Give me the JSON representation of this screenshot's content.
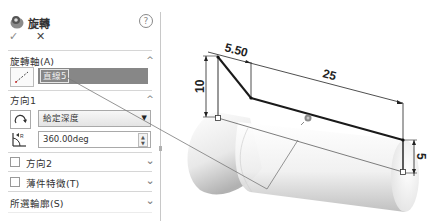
{
  "feature": {
    "title": "旋轉",
    "help_icon": "help-icon",
    "ok_icon": "check-icon",
    "cancel_icon": "close-icon",
    "ok_symbol": "✓",
    "cancel_symbol": "✕",
    "help_symbol": "?"
  },
  "axis_section": {
    "label": "旋轉軸(A)",
    "icon": "axis-line-icon",
    "selected_value": "直線5",
    "collapse_symbol": "^"
  },
  "direction1_section": {
    "label": "方向1",
    "collapse_symbol": "^",
    "direction_icon": "reverse-direction-icon",
    "end_condition": "給定深度",
    "end_condition_arrow": "▼",
    "angle_icon": "angle-icon",
    "angle_value": "360.00deg",
    "spin_up": "▲",
    "spin_down": "▼"
  },
  "direction2_section": {
    "label": "方向2",
    "checked": false,
    "expand_symbol": "⌄"
  },
  "thin_feature_section": {
    "label": "薄件特徵(T)",
    "checked": false,
    "expand_symbol": "⌄"
  },
  "selected_contours_section": {
    "label": "所選輪廓(S)",
    "expand_symbol": "⌄"
  },
  "graphics": {
    "dimensions": {
      "top_width": "5.50",
      "length": "25",
      "left_height": "10",
      "right_height": "5"
    },
    "origin_icon": "origin-icon",
    "colors": {
      "sketch_line": "#1a1a1a",
      "axis_line": "#777777",
      "selection_field": "#878787",
      "preview_body_light": "#ffffff",
      "preview_body_dark": "#b8b8b8"
    }
  }
}
